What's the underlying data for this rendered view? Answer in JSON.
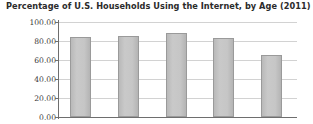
{
  "chart_data": {
    "type": "bar",
    "title": "Percentage of U.S. Households Using the Internet, by Age (2011)",
    "xlabel": "",
    "ylabel": "",
    "categories": [
      "",
      "",
      "",
      "",
      ""
    ],
    "values": [
      84,
      85,
      88,
      83,
      65
    ],
    "ylim": [
      0,
      100
    ],
    "ytick_labels": [
      "100.00",
      "80.00",
      "60.00",
      "40.00",
      "20.00",
      "0.00"
    ],
    "ytick_values": [
      100,
      80,
      60,
      40,
      20,
      0
    ],
    "grid": true,
    "legend": "none",
    "series": [
      {
        "name": "Percentage of households",
        "values": [
          84,
          85,
          88,
          83,
          65
        ]
      }
    ],
    "colors": {
      "bar_fill": "#c6c6c6",
      "bar_border": "#9a9a9a",
      "gridline": "#d2d2d2",
      "axis": "#6e6e6e",
      "title_text": "#2b2b2b",
      "tick_text": "#3a3a3a",
      "background": "#ffffff"
    }
  }
}
